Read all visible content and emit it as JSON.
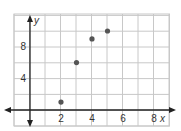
{
  "chart_data": {
    "type": "scatter",
    "title": "",
    "xlabel": "x",
    "ylabel": "y",
    "x": [
      2,
      3,
      4,
      5
    ],
    "y": [
      1,
      6,
      9,
      10
    ],
    "points": [
      {
        "x": 2,
        "y": 1
      },
      {
        "x": 3,
        "y": 6
      },
      {
        "x": 4,
        "y": 9
      },
      {
        "x": 5,
        "y": 10
      }
    ],
    "xticks": [
      2,
      4,
      6,
      8
    ],
    "yticks": [
      4,
      8
    ],
    "xlim": [
      -1,
      9
    ],
    "ylim": [
      -2,
      12
    ],
    "grid": true,
    "grid_step_x": 1,
    "grid_step_y": 2,
    "legend": null,
    "colors": {
      "grid": "#c8c8c8",
      "axis": "#222222",
      "point": "#555555"
    }
  }
}
